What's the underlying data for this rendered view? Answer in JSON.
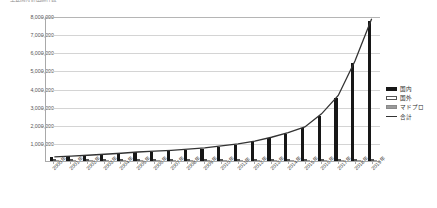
{
  "chart": {
    "title": "～ 主要国特許出願件数 ～",
    "legend_position": "right"
  },
  "chart_data": {
    "type": "bar",
    "title": "～ 主要国特許出願件数 ～",
    "xlabel": "",
    "ylabel": "",
    "ylim": [
      0,
      8000000
    ],
    "ytick_labels": [
      "8,000,000",
      "7,000,000",
      "6,000,000",
      "5,000,000",
      "4,000,000",
      "3,000,000",
      "2,000,000",
      "1,000,000"
    ],
    "ytick_values": [
      8000000,
      7000000,
      6000000,
      5000000,
      4000000,
      3000000,
      2000000,
      1000000
    ],
    "grid": true,
    "categories": [
      "2000年",
      "2001年",
      "2002年",
      "2003年",
      "2004年",
      "2005年",
      "2006年",
      "2007年",
      "2008年",
      "2009年",
      "2010年",
      "2011年",
      "2012年",
      "2013年",
      "2014年",
      "2015年",
      "2016年",
      "2017年",
      "2018年",
      "2019年"
    ],
    "series": [
      {
        "name": "国内",
        "type": "bar",
        "color": "#171717",
        "values": [
          210000,
          250000,
          300000,
          350000,
          400000,
          470000,
          520000,
          560000,
          620000,
          690000,
          790000,
          900000,
          1050000,
          1250000,
          1500000,
          1800000,
          2500000,
          3500000,
          5400000,
          7700000
        ]
      },
      {
        "name": "国外",
        "type": "bar",
        "color": "#ffffff",
        "values": [
          8000,
          9000,
          10000,
          11000,
          12000,
          13000,
          14000,
          15000,
          16000,
          18000,
          20000,
          23000,
          26000,
          30000,
          34000,
          40000,
          48000,
          58000,
          70000,
          85000
        ]
      },
      {
        "name": "マドプロ",
        "type": "bar",
        "color": "#9a9a9a",
        "values": [
          5000,
          6000,
          7000,
          8000,
          9000,
          10000,
          11000,
          12000,
          13000,
          14000,
          16000,
          18000,
          21000,
          24000,
          28000,
          33000,
          39000,
          46000,
          55000,
          66000
        ]
      },
      {
        "name": "合計",
        "type": "line",
        "color": "#333333",
        "values": [
          230000,
          270000,
          320000,
          375000,
          430000,
          500000,
          550000,
          595000,
          655000,
          730000,
          835000,
          950000,
          1110000,
          1320000,
          1580000,
          1890000,
          2620000,
          3640000,
          5560000,
          7900000
        ]
      }
    ],
    "legend": [
      "国内",
      "国外",
      "マドプロ",
      "合計"
    ]
  }
}
